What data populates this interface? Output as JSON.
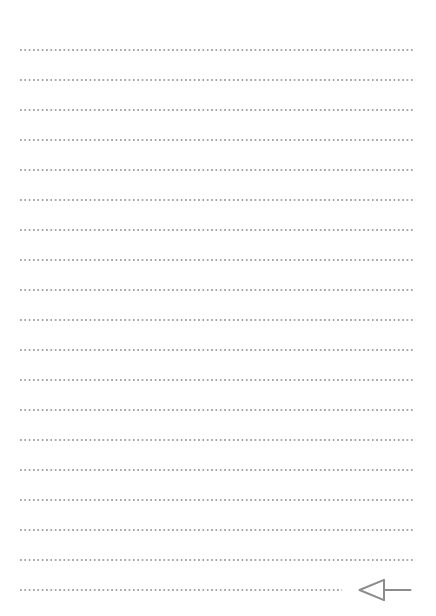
{
  "page": {
    "width": 436,
    "height": 616,
    "background_color": "#ffffff"
  },
  "ruling": {
    "style": "dotted",
    "line_color": "#a8a8a8",
    "line_count": 19,
    "first_line_y": 50,
    "line_spacing": 30,
    "left_x": 20,
    "right_x": 415,
    "dot_diameter": 1.6,
    "dot_pitch": 4.35,
    "lines": [
      {
        "index": 1,
        "y": 50,
        "x_start": 20,
        "x_end": 415
      },
      {
        "index": 2,
        "y": 80,
        "x_start": 20,
        "x_end": 415
      },
      {
        "index": 3,
        "y": 110,
        "x_start": 20,
        "x_end": 415
      },
      {
        "index": 4,
        "y": 140,
        "x_start": 20,
        "x_end": 415
      },
      {
        "index": 5,
        "y": 170,
        "x_start": 20,
        "x_end": 415
      },
      {
        "index": 6,
        "y": 200,
        "x_start": 20,
        "x_end": 415
      },
      {
        "index": 7,
        "y": 230,
        "x_start": 20,
        "x_end": 415
      },
      {
        "index": 8,
        "y": 260,
        "x_start": 20,
        "x_end": 415
      },
      {
        "index": 9,
        "y": 290,
        "x_start": 20,
        "x_end": 415
      },
      {
        "index": 10,
        "y": 320,
        "x_start": 20,
        "x_end": 415
      },
      {
        "index": 11,
        "y": 350,
        "x_start": 20,
        "x_end": 415
      },
      {
        "index": 12,
        "y": 380,
        "x_start": 20,
        "x_end": 415
      },
      {
        "index": 13,
        "y": 410,
        "x_start": 20,
        "x_end": 415
      },
      {
        "index": 14,
        "y": 440,
        "x_start": 20,
        "x_end": 415
      },
      {
        "index": 15,
        "y": 470,
        "x_start": 20,
        "x_end": 415
      },
      {
        "index": 16,
        "y": 500,
        "x_start": 20,
        "x_end": 415
      },
      {
        "index": 17,
        "y": 530,
        "x_start": 20,
        "x_end": 415
      },
      {
        "index": 18,
        "y": 560,
        "x_start": 20,
        "x_end": 415
      },
      {
        "index": 19,
        "y": 590,
        "x_start": 20,
        "x_end": 342
      }
    ]
  },
  "annotation": {
    "icon_name": "return-arrow-icon",
    "shape": "hollow-triangle-left-with-tail",
    "color": "#8c8c8c",
    "stroke_width": 2,
    "x": 358,
    "y": 590,
    "width": 54,
    "height": 24,
    "tip_x": 358,
    "tail_end_x": 412
  }
}
